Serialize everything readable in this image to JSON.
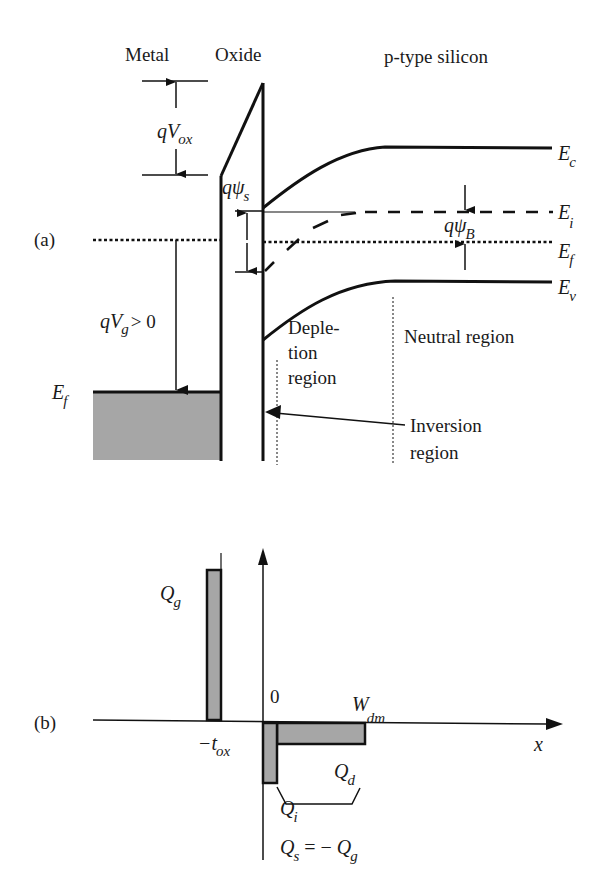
{
  "figure": {
    "colors": {
      "line": "#111111",
      "fill_gray": "#a6a6a6",
      "background": "#ffffff"
    },
    "panel_a": {
      "label": "(a)",
      "regions": {
        "metal": "Metal",
        "oxide": "Oxide",
        "silicon": "p-type silicon"
      },
      "energy_levels": {
        "Ec": {
          "main": "E",
          "sub": "c"
        },
        "Ei": {
          "main": "E",
          "sub": "i"
        },
        "Ef": {
          "main": "E",
          "sub": "f"
        },
        "Ev": {
          "main": "E",
          "sub": "v"
        },
        "Ef_metal": {
          "main": "E",
          "sub": "f"
        }
      },
      "annotations": {
        "qVox": {
          "main": "qV",
          "sub": "ox"
        },
        "qpsi_s": {
          "main": "qψ",
          "sub": "s"
        },
        "qpsi_B": {
          "main": "qψ",
          "sub": "B"
        },
        "qVg": {
          "main": "qV",
          "sub": "g",
          "suffix": "> 0"
        }
      },
      "region_labels": {
        "depletion_line1": "Deple-",
        "depletion_line2": "tion",
        "depletion_line3": "region",
        "neutral": "Neutral region",
        "inversion_line1": "Inversion",
        "inversion_line2": "region"
      }
    },
    "panel_b": {
      "label": "(b)",
      "axis_x_label": "x",
      "origin_label": "0",
      "tox": {
        "main": "−t",
        "sub": "ox"
      },
      "Wdm": {
        "main": "W",
        "sub": "dm"
      },
      "Qg": {
        "main": "Q",
        "sub": "g"
      },
      "Qd": {
        "main": "Q",
        "sub": "d"
      },
      "Qi": {
        "main": "Q",
        "sub": "i"
      },
      "Qs_equation": {
        "lhs_main": "Q",
        "lhs_sub": "s",
        "mid": " = − ",
        "rhs_main": "Q",
        "rhs_sub": "g"
      }
    }
  }
}
